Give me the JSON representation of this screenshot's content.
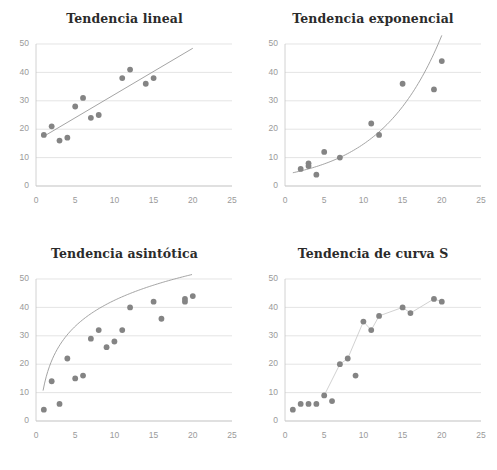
{
  "figure": {
    "background": "#ffffff",
    "dot_color": "#848484",
    "trend_color": "#9a9a9a",
    "grid_color": "#d9d9d9",
    "axis_color": "#c6c6c6",
    "tick_color": "#9a9a9a",
    "title_color": "#2b2b2b",
    "layout": "2x2"
  },
  "chart_data": [
    {
      "type": "scatter",
      "title": "Tendencia lineal",
      "xlabel": "",
      "ylabel": "",
      "xlim": [
        0,
        25
      ],
      "ylim": [
        0,
        50
      ],
      "xticks": [
        0,
        5,
        10,
        15,
        20,
        25
      ],
      "yticks": [
        0,
        10,
        20,
        30,
        40,
        50
      ],
      "grid": true,
      "legend": "none",
      "x": [
        1,
        2,
        3,
        4,
        5,
        6,
        7,
        8,
        11,
        12,
        14,
        15
      ],
      "y": [
        18,
        21,
        16,
        17,
        28,
        31,
        24,
        25,
        38,
        41,
        36,
        38
      ],
      "trend": {
        "kind": "linear",
        "points_x": [
          1,
          20
        ],
        "points_y": [
          17.5,
          48.5
        ]
      }
    },
    {
      "type": "scatter",
      "title": "Tendencia exponencial",
      "xlabel": "",
      "ylabel": "",
      "xlim": [
        0,
        25
      ],
      "ylim": [
        0,
        50
      ],
      "xticks": [
        0,
        5,
        10,
        15,
        20,
        25
      ],
      "yticks": [
        0,
        10,
        20,
        30,
        40,
        50
      ],
      "grid": true,
      "legend": "none",
      "x": [
        2,
        3,
        3,
        4,
        5,
        7,
        11,
        12,
        15,
        19,
        20
      ],
      "y": [
        6,
        8,
        7,
        4,
        12,
        10,
        22,
        18,
        36,
        34,
        44
      ],
      "trend": {
        "kind": "exponential",
        "a": 4.1,
        "b": 0.128,
        "x_from": 1,
        "x_to": 20
      }
    },
    {
      "type": "scatter",
      "title": "Tendencia asintótica",
      "xlabel": "",
      "ylabel": "",
      "xlim": [
        0,
        25
      ],
      "ylim": [
        0,
        50
      ],
      "xticks": [
        0,
        5,
        10,
        15,
        20,
        25
      ],
      "yticks": [
        0,
        10,
        20,
        30,
        40,
        50
      ],
      "grid": true,
      "legend": "none",
      "x": [
        1,
        2,
        3,
        4,
        5,
        6,
        7,
        8,
        9,
        10,
        11,
        12,
        15,
        16,
        19,
        19,
        20
      ],
      "y": [
        4,
        14,
        6,
        22,
        15,
        16,
        29,
        32,
        26,
        28,
        32,
        40,
        42,
        36,
        42,
        43,
        44
      ],
      "trend": {
        "kind": "logarithmic",
        "a": 13.2,
        "b": 0.4,
        "x_from": 0.9,
        "x_to": 20
      }
    },
    {
      "type": "scatter",
      "title": "Tendencia de curva S",
      "xlabel": "",
      "ylabel": "",
      "xlim": [
        0,
        25
      ],
      "ylim": [
        0,
        50
      ],
      "xticks": [
        0,
        5,
        10,
        15,
        20,
        25
      ],
      "yticks": [
        0,
        10,
        20,
        30,
        40,
        50
      ],
      "grid": true,
      "legend": "none",
      "x": [
        1,
        2,
        3,
        4,
        5,
        6,
        7,
        8,
        9,
        10,
        11,
        12,
        15,
        16,
        19,
        20
      ],
      "y": [
        4,
        6,
        6,
        6,
        9,
        7,
        20,
        22,
        16,
        35,
        32,
        37,
        40,
        38,
        43,
        42
      ],
      "trend": {
        "kind": "sigmoid-connector",
        "connect_x": [
          5,
          7,
          8,
          10,
          11,
          12,
          15,
          16,
          19,
          20
        ],
        "connect_y": [
          9,
          20,
          22,
          35,
          32,
          37,
          40,
          38,
          43,
          42
        ]
      }
    }
  ]
}
